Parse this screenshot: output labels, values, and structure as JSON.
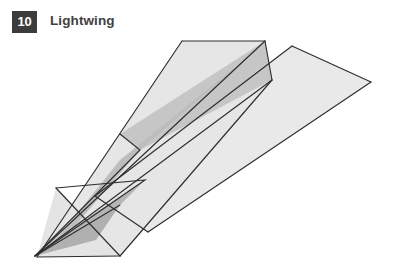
{
  "header": {
    "badge_number": "10",
    "title": "Lightwing"
  },
  "illustration": {
    "name": "paper-airplane-diagram",
    "description": "Dart-style folded paper airplane seen from above-left, nose pointing down-left",
    "background_color": "#ffffff",
    "outline_color": "#2e2e2e",
    "palette": {
      "wing_light": "#e9e9e9",
      "wing_light_alt": "#e4e4e4",
      "fold_mid": "#d2d2d2",
      "fold_dark": "#bdbdbd",
      "fold_darkest": "#b0b0b0",
      "keel_shade": "#c6c6c6"
    },
    "shapes": [
      {
        "name": "far-wing",
        "fill": "#e9e9e9",
        "points": "292,16 371,52 148,202 95,166"
      },
      {
        "name": "near-wing",
        "fill": "#e6e6e6",
        "points": "182,11 265,11 272,50 120,226 37,227"
      },
      {
        "name": "near-wing-underside",
        "fill": "#e4e4e4",
        "points": "56,158 120,226 37,227"
      },
      {
        "name": "keel-upper",
        "fill": "#c6c6c6",
        "points": "265,11 272,50 140,120 120,104"
      },
      {
        "name": "keel-spine",
        "fill": "#bdbdbd",
        "points": "265,13 140,120 75,196 35,226 60,205 120,130"
      },
      {
        "name": "keel-lower",
        "fill": "#b6b6b6",
        "points": "35,226 75,196 145,150 120,175"
      },
      {
        "name": "nose-shadow",
        "fill": "#b0b0b0",
        "points": "35,226 120,175 96,210"
      }
    ],
    "fold_lines": [
      {
        "name": "far-wing-leading-edge",
        "d": "M292,16 L371,52"
      },
      {
        "name": "far-wing-trailing-edge",
        "d": "M371,52 L148,202"
      },
      {
        "name": "far-wing-inner-edge",
        "d": "M148,202 L95,166"
      },
      {
        "name": "far-wing-root",
        "d": "M95,166 L292,16"
      },
      {
        "name": "near-wing-top-edge",
        "d": "M182,11 L265,11"
      },
      {
        "name": "near-wing-right-step",
        "d": "M265,11 L272,50"
      },
      {
        "name": "near-wing-left-edge",
        "d": "M182,11 L37,227"
      },
      {
        "name": "near-wing-lower-edge",
        "d": "M272,50 L120,226"
      },
      {
        "name": "near-wing-tail-edge",
        "d": "M120,226 L37,227"
      },
      {
        "name": "center-keel-top",
        "d": "M265,11 L35,226"
      },
      {
        "name": "center-keel-bottom",
        "d": "M272,50 L35,226"
      },
      {
        "name": "inner-fold-upper",
        "d": "M120,104 L140,120 L35,226"
      },
      {
        "name": "inner-fold-lower",
        "d": "M56,158 L145,150 L35,226"
      },
      {
        "name": "nose-crease",
        "d": "M120,175 L35,226"
      },
      {
        "name": "wing-corner-left",
        "d": "M56,158 L120,226"
      }
    ]
  }
}
